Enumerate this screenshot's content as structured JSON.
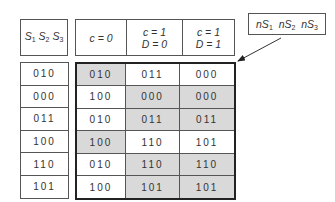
{
  "left_header": {
    "text": "S1 S2 S3",
    "parts": [
      {
        "base": "S",
        "sub": "1"
      },
      {
        "base": "S",
        "sub": "2"
      },
      {
        "base": "S",
        "sub": "3"
      }
    ]
  },
  "right_headers": [
    {
      "line1": "c = 0",
      "line2": ""
    },
    {
      "line1": "c = 1",
      "line2": "D = 0"
    },
    {
      "line1": "c = 1",
      "line2": "D = 1"
    }
  ],
  "label": {
    "text": "nS1 nS2 nS3",
    "parts": [
      {
        "base": "nS",
        "sub": "1"
      },
      {
        "base": "nS",
        "sub": "2"
      },
      {
        "base": "nS",
        "sub": "3"
      }
    ]
  },
  "current_states": [
    "010",
    "000",
    "011",
    "100",
    "110",
    "101"
  ],
  "next_states": [
    [
      {
        "v": "010",
        "shaded": true
      },
      {
        "v": "011",
        "shaded": false
      },
      {
        "v": "000",
        "shaded": false
      }
    ],
    [
      {
        "v": "100",
        "shaded": false
      },
      {
        "v": "000",
        "shaded": true
      },
      {
        "v": "000",
        "shaded": true
      }
    ],
    [
      {
        "v": "010",
        "shaded": false
      },
      {
        "v": "011",
        "shaded": true
      },
      {
        "v": "011",
        "shaded": true
      }
    ],
    [
      {
        "v": "100",
        "shaded": true
      },
      {
        "v": "110",
        "shaded": false
      },
      {
        "v": "101",
        "shaded": false
      }
    ],
    [
      {
        "v": "010",
        "shaded": false
      },
      {
        "v": "110",
        "shaded": true
      },
      {
        "v": "110",
        "shaded": true
      }
    ],
    [
      {
        "v": "100",
        "shaded": false
      },
      {
        "v": "101",
        "shaded": true
      },
      {
        "v": "101",
        "shaded": true
      }
    ]
  ],
  "colors": {
    "shade": "#d9d9d9",
    "border": "#555555",
    "thick_border": "#222222"
  }
}
